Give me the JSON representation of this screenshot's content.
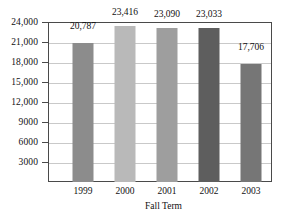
{
  "chart_data": {
    "type": "bar",
    "title": "",
    "subtitle": "",
    "xlabel": "Fall Term",
    "ylabel": "",
    "categories": [
      "1999",
      "2000",
      "2001",
      "2002",
      "2003"
    ],
    "values": [
      20787,
      23416,
      23090,
      23033,
      17706
    ],
    "value_labels": [
      "20,787",
      "23,416",
      "23,090",
      "23,033",
      "17,706"
    ],
    "bar_colors": [
      "#8c8c8c",
      "#b9b9b9",
      "#9e9e9e",
      "#5e5e5e",
      "#767676"
    ],
    "ylim": [
      0,
      24000
    ],
    "ytick_values": [
      24000,
      21000,
      18000,
      15000,
      12000,
      9000,
      6000,
      3000
    ],
    "ytick_labels": [
      "24,000",
      "21,000",
      "18,000",
      "15,000",
      "12,000",
      "9000",
      "6000",
      "3000"
    ],
    "grid": true,
    "grid_orientation": "horizontal",
    "grid_color": "#c9c9c9",
    "legend": null,
    "legend_position": "none",
    "axis_color": "#4a4a4a",
    "background_color": "#ffffff",
    "annotations": []
  }
}
